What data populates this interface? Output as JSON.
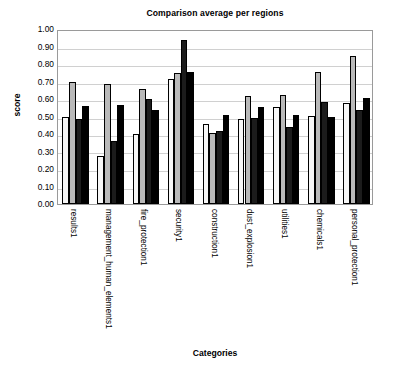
{
  "chart_data": {
    "type": "bar",
    "title": "Comparison average per regions",
    "xlabel": "Categories",
    "ylabel": "score",
    "ylim": [
      0,
      1
    ],
    "ytick_step": 0.1,
    "ytick_labels": [
      "1.00",
      "0.90",
      "0.80",
      "0.70",
      "0.60",
      "0.50",
      "0.40",
      "0.30",
      "0.20",
      "0.10",
      "0.00"
    ],
    "grid": true,
    "legend": "none",
    "orientation": "vertical",
    "group_mode": "clustered",
    "categories": [
      "results1",
      "management_human_elements1",
      "fire_protection1",
      "security1",
      "construction1",
      "dust_explosion1",
      "utilities1",
      "chemicals1",
      "personal_protection1"
    ],
    "series": [
      {
        "name": "series-1",
        "color": "#f7f7f7",
        "values": [
          0.5,
          0.275,
          0.4,
          0.715,
          0.46,
          0.485,
          0.555,
          0.505,
          0.575
        ]
      },
      {
        "name": "series-2",
        "color": "#b9b9b9",
        "values": [
          0.695,
          0.685,
          0.655,
          0.75,
          0.405,
          0.615,
          0.625,
          0.755,
          0.845
        ]
      },
      {
        "name": "series-3",
        "color": "#1c1c1c",
        "values": [
          0.485,
          0.36,
          0.6,
          0.94,
          0.415,
          0.49,
          0.44,
          0.585,
          0.54
        ]
      },
      {
        "name": "series-4",
        "color": "#000000",
        "values": [
          0.56,
          0.565,
          0.535,
          0.755,
          0.51,
          0.555,
          0.51,
          0.495,
          0.605
        ]
      }
    ]
  }
}
